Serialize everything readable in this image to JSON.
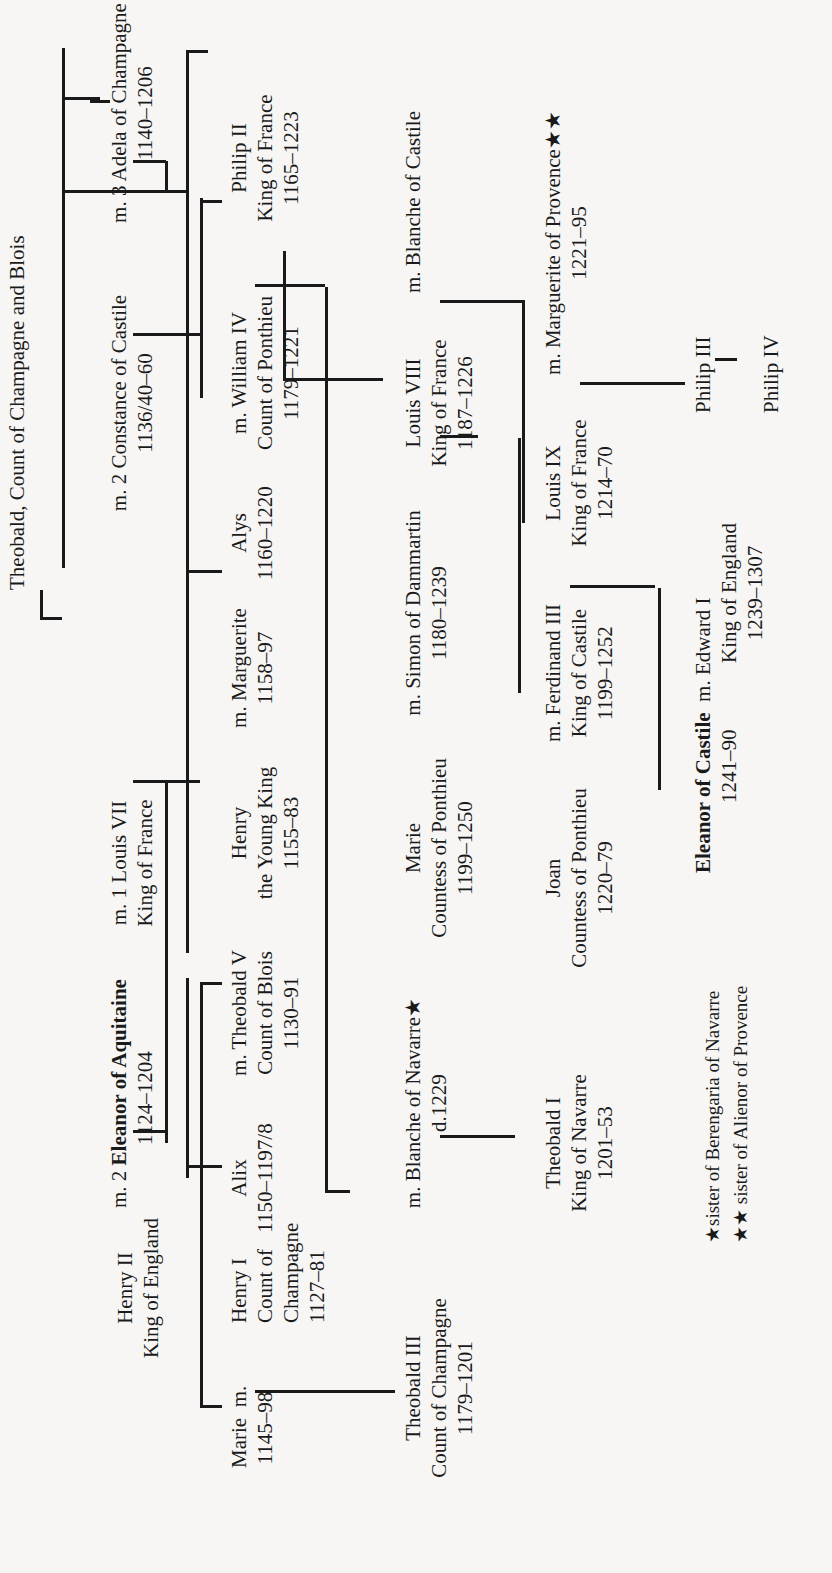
{
  "root": {
    "name": "Theobald, Count of Champagne and Blois"
  },
  "persons": {
    "henry_ii": {
      "name": "Henry II",
      "title": "King of England"
    },
    "eleanor_aquitaine": {
      "prefix": "m. 2",
      "name": "Eleanor of Aquitaine",
      "dates": "1124–1204"
    },
    "louis_vii": {
      "name": "m. 1 Louis VII",
      "title": "King of France"
    },
    "constance": {
      "name": "m. 2 Constance of Castile",
      "dates": "1136/40–60"
    },
    "adela": {
      "name": "m. 3 Adela of Champagne",
      "dates": "1140–1206"
    },
    "marie": {
      "name": "Marie",
      "dates": "1145–98",
      "marr": "m."
    },
    "henry_i": {
      "name": "Henry I",
      "title1": "Count of",
      "title2": "Champagne",
      "dates": "1127–81"
    },
    "alix": {
      "name": "Alix",
      "dates": "1150–1197/8"
    },
    "theobald_v": {
      "name": "m. Theobald V",
      "title": "Count of Blois",
      "dates": "1130–91"
    },
    "henry_young": {
      "name": "Henry",
      "title": "the Young King",
      "dates": "1155–83"
    },
    "marguerite": {
      "name": "m. Marguerite",
      "dates": "1158–97"
    },
    "alys": {
      "name": "Alys",
      "dates": "1160–1220"
    },
    "william_iv": {
      "name": "m. William IV",
      "title": "Count of Ponthieu",
      "dates": "1179–1221"
    },
    "philip_ii": {
      "name": "Philip II",
      "title": "King of France",
      "dates": "1165–1223"
    },
    "theobald_iii": {
      "name": "Theobald III",
      "title": "Count of Champagne",
      "dates": "1179–1201"
    },
    "blanche_navarre": {
      "name": "m. Blanche of Navarre★",
      "dates": "d.1229"
    },
    "marie_ponthieu": {
      "name": "Marie",
      "title": "Countess of Ponthieu",
      "dates": "1199–1250"
    },
    "simon": {
      "name": "m. Simon of Dammartin",
      "dates": "1180–1239"
    },
    "louis_viii": {
      "name": "Louis VIII",
      "title": "King of France",
      "dates": "1187–1226"
    },
    "blanche_castile": {
      "name": "m. Blanche of Castile"
    },
    "theobald_i": {
      "name": "Theobald I",
      "title": "King of Navarre",
      "dates": "1201–53"
    },
    "joan": {
      "name": "Joan",
      "title": "Countess of Ponthieu",
      "dates": "1220–79"
    },
    "ferdinand_iii": {
      "name": "m. Ferdinand III",
      "title": "King of Castile",
      "dates": "1199–1252"
    },
    "louis_ix": {
      "name": "Louis IX",
      "title": "King of France",
      "dates": "1214–70"
    },
    "marguerite_provence": {
      "name": "m. Marguerite of Provence★★",
      "dates": "1221–95"
    },
    "eleanor_castile": {
      "name": "Eleanor of Castile",
      "marr": "m. Edward I",
      "dates": "1241–90"
    },
    "edward_i": {
      "title": "King of England",
      "dates": "1239–1307"
    },
    "philip_iii": {
      "name": "Philip III"
    },
    "philip_iv": {
      "name": "Philip IV"
    }
  },
  "footnotes": [
    "★sister of Berengaria of Navarre",
    "★★ sister of Alienor of Provence"
  ]
}
